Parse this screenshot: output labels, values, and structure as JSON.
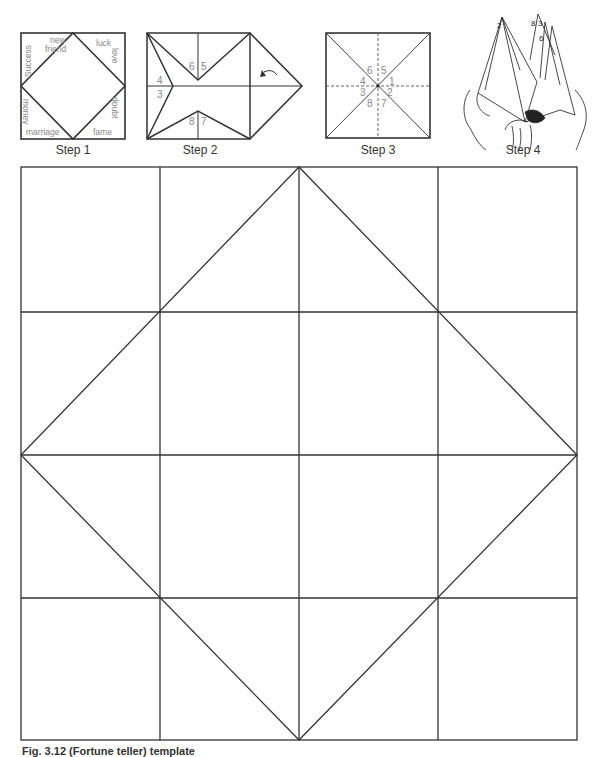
{
  "steps": [
    {
      "label": "Step 1"
    },
    {
      "label": "Step 2"
    },
    {
      "label": "Step 3"
    },
    {
      "label": "Step 4"
    }
  ],
  "step1": {
    "words": {
      "new": "new",
      "friend": "friend",
      "luck": "luck",
      "love": "love",
      "success": "Success",
      "money": "money",
      "doubt": "doubt",
      "marriage": "marriage",
      "fame": "fame"
    }
  },
  "step2": {
    "numbers": {
      "n6": "6",
      "n5": "5",
      "n4": "4",
      "n3": "3",
      "n8": "8",
      "n7": "7"
    }
  },
  "step3": {
    "numbers": {
      "n6": "6",
      "n5": "5",
      "n4": "4",
      "n1": "1",
      "n3": "3",
      "n2": "2",
      "n8": "8",
      "n7": "7"
    }
  },
  "step4": {
    "numbers": {
      "a": "2",
      "b": "8",
      "c": "3",
      "d": "6"
    }
  },
  "template": {
    "rows": 4,
    "cols": 4,
    "line_color": "#333333"
  },
  "caption": "Fig. 3.12 (Fortune teller) template"
}
